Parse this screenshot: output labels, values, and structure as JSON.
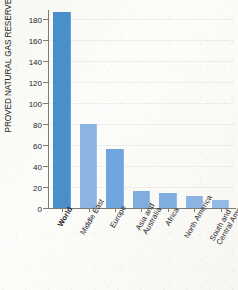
{
  "chart_data": {
    "type": "bar",
    "title": "",
    "xlabel": "",
    "ylabel": "PROVED NATURAL GAS RESERVES (trillion m³)",
    "categories": [
      "World",
      "Middle East",
      "Europe",
      "Asia and\nAustralia",
      "Africa",
      "North America",
      "South and\nCentral America"
    ],
    "values": [
      187,
      80,
      56,
      16,
      14,
      11,
      8
    ],
    "ylim": [
      0,
      190
    ],
    "yticks": [
      0,
      20,
      40,
      60,
      80,
      100,
      120,
      140,
      160,
      180
    ],
    "ytick_labels": [
      "0",
      "20",
      "40",
      "60",
      "80",
      "100",
      "120",
      "140",
      "160",
      "180"
    ],
    "grid": false,
    "legend": "none",
    "bar_colors": [
      "#4a8fcb",
      "#8cb4e2",
      "#6fa6dd",
      "#7fadde",
      "#7fadde",
      "#8cb4e2",
      "#93b9e4"
    ],
    "highlight_category": "World"
  },
  "axis": {
    "line_color": "#7d7d76"
  }
}
